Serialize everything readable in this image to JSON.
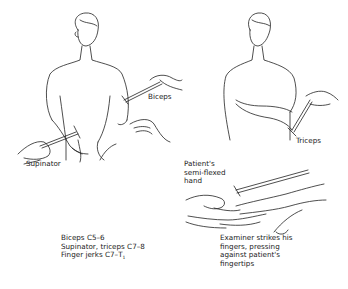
{
  "figure": {
    "panels": [
      {
        "id": "biceps-supinator",
        "labels": [
          "Biceps",
          "Supinator"
        ]
      },
      {
        "id": "triceps",
        "labels": [
          "Triceps"
        ]
      },
      {
        "id": "finger-jerk",
        "labels": [
          "Patient's semi-flexed hand",
          "Examiner strikes his fingers, pressing against patient's fingertips"
        ]
      }
    ],
    "labels": {
      "biceps": "Biceps",
      "supinator": "Supinator",
      "triceps": "Triceps",
      "patient_hand_1": "Patient's",
      "patient_hand_2": "semi-flexed",
      "patient_hand_3": "hand",
      "examiner_1": "Examiner strikes his",
      "examiner_2": "fingers, pressing",
      "examiner_3": "against patient's",
      "examiner_4": "fingertips"
    },
    "legend": {
      "line1": "Biceps C5–6",
      "line2": "Supinator, triceps C7–8",
      "line3_main": "Finger jerks C7–T",
      "line3_sub": "1"
    }
  }
}
